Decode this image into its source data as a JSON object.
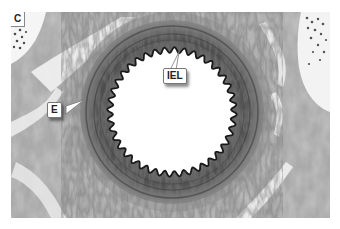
{
  "figure": {
    "panel_label": "C",
    "labels": {
      "iel": "IEL",
      "e": "E"
    },
    "colors": {
      "background": "#ffffff",
      "tissue_light": "#c8c8c8",
      "tissue_mid": "#8a8a8a",
      "media_dark": "#5a5a5a",
      "lamina": "#1e1e1e",
      "lumen": "#ffffff"
    }
  }
}
